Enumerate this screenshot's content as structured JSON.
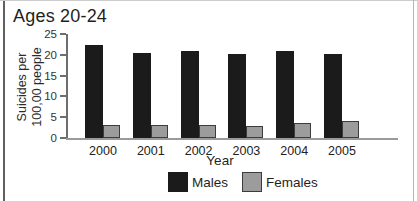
{
  "chart_data": {
    "type": "bar",
    "title": "Ages 20-24",
    "categories": [
      "2000",
      "2001",
      "2002",
      "2003",
      "2004",
      "2005"
    ],
    "series": [
      {
        "name": "Males",
        "color": "#1b1b1b",
        "border": "#1b1b1b",
        "values": [
          22.3,
          20.5,
          21.0,
          20.3,
          20.9,
          20.2
        ]
      },
      {
        "name": "Females",
        "color": "#9c9c9c",
        "border": "#3c3c3c",
        "values": [
          3.2,
          3.1,
          3.2,
          3.0,
          3.6,
          4.2
        ]
      }
    ],
    "xlabel": "Year",
    "ylabel": "Suicides per\n100,00 people",
    "ylim": [
      0,
      25
    ],
    "yticks": [
      0,
      5,
      10,
      15,
      20,
      25
    ],
    "grid": false,
    "legend_position": "bottom"
  },
  "panel": {
    "axis_color": "#6e6e6e",
    "baseline_color": "#9a9a9a"
  }
}
